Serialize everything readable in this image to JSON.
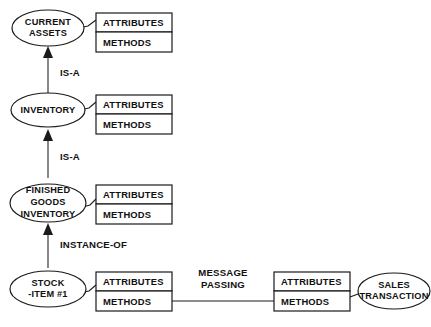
{
  "diagram": {
    "background_color": "#ffffff",
    "line_color": "#1a1a1a",
    "classes": [
      {
        "id": "current-assets",
        "name_lines": [
          "CURRENT",
          "ASSETS"
        ],
        "attributes_label": "ATTRIBUTES",
        "methods_label": "METHODS"
      },
      {
        "id": "inventory",
        "name_lines": [
          "INVENTORY"
        ],
        "attributes_label": "ATTRIBUTES",
        "methods_label": "METHODS"
      },
      {
        "id": "finished-goods-inventory",
        "name_lines": [
          "FINISHED",
          "GOODS",
          "INVENTORY"
        ],
        "attributes_label": "ATTRIBUTES",
        "methods_label": "METHODS"
      },
      {
        "id": "stock-item-1",
        "name_lines": [
          "STOCK",
          "-ITEM #1"
        ],
        "attributes_label": "ATTRIBUTES",
        "methods_label": "METHODS"
      },
      {
        "id": "sales-transaction",
        "name_lines": [
          "SALES",
          "TRANSACTION"
        ],
        "attributes_label": "ATTRIBUTES",
        "methods_label": "METHODS"
      }
    ],
    "relationships": [
      {
        "id": "is-a-1",
        "label": "IS-A",
        "from": "inventory",
        "to": "current-assets"
      },
      {
        "id": "is-a-2",
        "label": "IS-A",
        "from": "finished-goods-inventory",
        "to": "inventory"
      },
      {
        "id": "instance-of",
        "label": "INSTANCE-OF",
        "from": "stock-item-1",
        "to": "finished-goods-inventory"
      },
      {
        "id": "message-passing",
        "label_lines": [
          "MESSAGE",
          "PASSING"
        ],
        "from": "stock-item-1",
        "to": "sales-transaction"
      }
    ]
  }
}
